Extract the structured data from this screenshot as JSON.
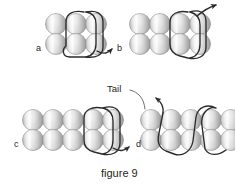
{
  "figure": {
    "caption": "figure 9",
    "annotation_tail": "Tail",
    "panels": [
      {
        "id": "a",
        "label": "a",
        "rows": 2,
        "columns": 3,
        "thread_direction": "exits bottom-right",
        "arrow_count": 1
      },
      {
        "id": "b",
        "label": "b",
        "rows": 2,
        "columns": 4,
        "thread_direction": "exits top-right",
        "arrow_count": 1
      },
      {
        "id": "c",
        "label": "c",
        "rows": 2,
        "columns": 5,
        "thread_direction": "exits bottom-right",
        "arrow_count": 1
      },
      {
        "id": "d",
        "label": "d",
        "rows": 2,
        "columns": 5,
        "thread_direction": "exits top-left",
        "arrow_count": 1
      }
    ]
  },
  "colors": {
    "background": "#ffffff",
    "thread": "#2b2b2b",
    "bead_light": "#f2f2f2",
    "bead_mid": "#d4d4d4",
    "bead_dark": "#9a9a9a",
    "bead_outline": "#8a8a8a",
    "text": "#231f20",
    "leader": "#6d6d6d"
  }
}
